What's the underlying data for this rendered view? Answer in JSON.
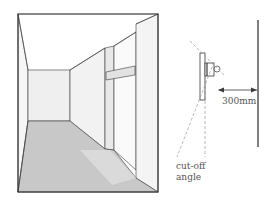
{
  "figure": {
    "left_panel": {
      "description": "perspective view of corridor with wall-mounted light casting lit patch on floor"
    },
    "right_panel": {
      "description": "section showing wall-mounted luminaire, cut-off angle and clearance to opposite wall",
      "dimension_label": "300mm",
      "cutoff_label_line1": "cut-off",
      "cutoff_label_line2": "angle"
    }
  },
  "colors": {
    "line": "#3a3a3a",
    "floor": "#c8c8c8",
    "floor_lit": "#dadada",
    "wall_light": "#f4f4f4",
    "wall_mid": "#ececec",
    "dashed": "#9a9a9a",
    "text": "#555555"
  }
}
